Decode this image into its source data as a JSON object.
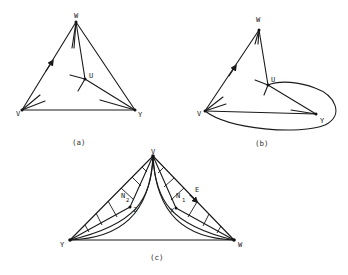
{
  "figure": {
    "panels": [
      {
        "id": "a",
        "caption": "(a)",
        "vertices": {
          "W": "W",
          "V": "V",
          "Y": "Y",
          "U": "U"
        }
      },
      {
        "id": "b",
        "caption": "(b)",
        "vertices": {
          "W": "W",
          "V": "V",
          "Y": "Y",
          "U": "U"
        }
      },
      {
        "id": "c",
        "caption": "(c)",
        "vertices": {
          "V": "V",
          "Y": "Y",
          "W": "W",
          "Z": "Z",
          "X": "X",
          "E": "E"
        },
        "regions": {
          "N2": "N",
          "N2_sub": "2",
          "N1": "N",
          "N1_sub": "1"
        }
      }
    ]
  }
}
